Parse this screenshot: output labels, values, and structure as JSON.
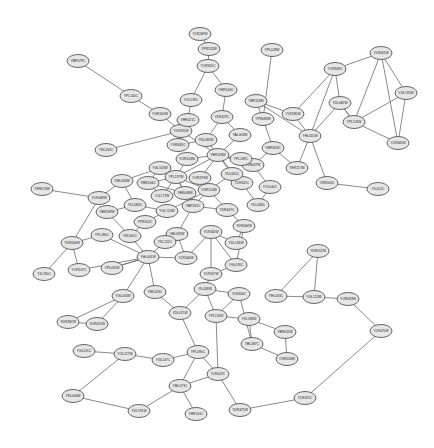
{
  "figure": {
    "type": "node-link-network-graph",
    "background_color": "#ffffff",
    "node_fill_color": "#e6e6e6",
    "node_stroke_color": "#555555",
    "edge_color": "#6b6b6b",
    "label_color": "#1a1a1a",
    "node_count": 97,
    "edge_count": 134,
    "node_shape": "ellipse",
    "node_width": 22,
    "node_height": 13,
    "label_format": "yeast-orf-identifier"
  },
  "graph_data": {
    "type": "network",
    "layout": "force-directed-spring",
    "width": 434,
    "height": 448,
    "nodes": [
      {
        "id": "n0",
        "label": "YLR249W",
        "x": 200,
        "y": 34
      },
      {
        "id": "n1",
        "label": "YPL028W",
        "x": 272,
        "y": 50
      },
      {
        "id": "n2",
        "label": "YOR361C",
        "x": 208,
        "y": 66
      },
      {
        "id": "n3",
        "label": "YBR079C",
        "x": 78,
        "y": 61
      },
      {
        "id": "n4",
        "label": "YPL140C",
        "x": 131,
        "y": 96
      },
      {
        "id": "n5",
        "label": "YGR162W",
        "x": 160,
        "y": 114
      },
      {
        "id": "n6",
        "label": "YOL139C",
        "x": 191,
        "y": 100
      },
      {
        "id": "n7",
        "label": "YMR146C",
        "x": 226,
        "y": 90
      },
      {
        "id": "n8",
        "label": "YDR429C",
        "x": 222,
        "y": 117
      },
      {
        "id": "n9",
        "label": "YBR118W",
        "x": 256,
        "y": 101
      },
      {
        "id": "n10",
        "label": "YPR080W",
        "x": 263,
        "y": 119
      },
      {
        "id": "n11",
        "label": "YLR335W",
        "x": 181,
        "y": 131
      },
      {
        "id": "n12",
        "label": "YKL081W",
        "x": 206,
        "y": 140
      },
      {
        "id": "n13",
        "label": "YAL003W",
        "x": 240,
        "y": 135
      },
      {
        "id": "n14",
        "label": "YBR118W",
        "x": 218,
        "y": 155
      },
      {
        "id": "n15",
        "label": "YMR309C",
        "x": 273,
        "y": 148
      },
      {
        "id": "n16",
        "label": "YJR007W",
        "x": 253,
        "y": 165
      },
      {
        "id": "n17",
        "label": "YOR204W",
        "x": 187,
        "y": 159
      },
      {
        "id": "n18",
        "label": "YNL244C",
        "x": 106,
        "y": 150
      },
      {
        "id": "n19",
        "label": "YMR146C",
        "x": 148,
        "y": 183
      },
      {
        "id": "n20",
        "label": "YPL237W",
        "x": 176,
        "y": 177
      },
      {
        "id": "n21",
        "label": "YGR214W",
        "x": 209,
        "y": 190
      },
      {
        "id": "n22",
        "label": "YLR441C",
        "x": 242,
        "y": 183
      },
      {
        "id": "n23",
        "label": "YOL040C",
        "x": 270,
        "y": 187
      },
      {
        "id": "n24",
        "label": "YBR181C",
        "x": 193,
        "y": 206
      },
      {
        "id": "n25",
        "label": "YDR447C",
        "x": 227,
        "y": 210
      },
      {
        "id": "n26",
        "label": "YGL123W",
        "x": 167,
        "y": 211
      },
      {
        "id": "n27",
        "label": "YDL083C",
        "x": 135,
        "y": 205
      },
      {
        "id": "n28",
        "label": "YER074W",
        "x": 42,
        "y": 189
      },
      {
        "id": "n29",
        "label": "YLR048W",
        "x": 99,
        "y": 198
      },
      {
        "id": "n30",
        "label": "YPL090C",
        "x": 102,
        "y": 235
      },
      {
        "id": "n31",
        "label": "YDR064W",
        "x": 72,
        "y": 243
      },
      {
        "id": "n32",
        "label": "YJL190C",
        "x": 44,
        "y": 274
      },
      {
        "id": "n33",
        "label": "YOR167C",
        "x": 79,
        "y": 270
      },
      {
        "id": "n34",
        "label": "YPL081W",
        "x": 112,
        "y": 268
      },
      {
        "id": "n35",
        "label": "YHL001W",
        "x": 148,
        "y": 257
      },
      {
        "id": "n36",
        "label": "YLR344W",
        "x": 186,
        "y": 258
      },
      {
        "id": "n37",
        "label": "YBL092W",
        "x": 177,
        "y": 234
      },
      {
        "id": "n38",
        "label": "YLR340W",
        "x": 211,
        "y": 232
      },
      {
        "id": "n39",
        "label": "YDL136W",
        "x": 236,
        "y": 243
      },
      {
        "id": "n40",
        "label": "YGL030W",
        "x": 123,
        "y": 296
      },
      {
        "id": "n41",
        "label": "YML026C",
        "x": 155,
        "y": 292
      },
      {
        "id": "n42",
        "label": "YDR382W",
        "x": 68,
        "y": 322
      },
      {
        "id": "n43",
        "label": "YIL018W",
        "x": 205,
        "y": 289
      },
      {
        "id": "n44",
        "label": "YLR406C",
        "x": 239,
        "y": 294
      },
      {
        "id": "n45",
        "label": "YDL075W",
        "x": 180,
        "y": 313
      },
      {
        "id": "n46",
        "label": "YPL131W",
        "x": 216,
        "y": 316
      },
      {
        "id": "n47",
        "label": "YKL180W",
        "x": 249,
        "y": 319
      },
      {
        "id": "n48",
        "label": "YBR031W",
        "x": 285,
        "y": 332
      },
      {
        "id": "n49",
        "label": "YHL033C",
        "x": 276,
        "y": 296
      },
      {
        "id": "n50",
        "label": "YGL123W",
        "x": 314,
        "y": 297
      },
      {
        "id": "n51",
        "label": "YOR063W",
        "x": 348,
        "y": 299
      },
      {
        "id": "n52",
        "label": "YDR012W",
        "x": 318,
        "y": 251
      },
      {
        "id": "n53",
        "label": "YLR075W",
        "x": 381,
        "y": 331
      },
      {
        "id": "n54",
        "label": "YGL031C",
        "x": 84,
        "y": 351
      },
      {
        "id": "n55",
        "label": "YOL127W",
        "x": 125,
        "y": 354
      },
      {
        "id": "n56",
        "label": "YGL147C",
        "x": 163,
        "y": 360
      },
      {
        "id": "n57",
        "label": "YPL090C",
        "x": 198,
        "y": 352
      },
      {
        "id": "n58",
        "label": "YLR029C",
        "x": 218,
        "y": 374
      },
      {
        "id": "n59",
        "label": "YML073C",
        "x": 180,
        "y": 386
      },
      {
        "id": "n60",
        "label": "YDL191W",
        "x": 139,
        "y": 411
      },
      {
        "id": "n61",
        "label": "YKL006W",
        "x": 73,
        "y": 396
      },
      {
        "id": "n62",
        "label": "YHR141C",
        "x": 196,
        "y": 414
      },
      {
        "id": "n63",
        "label": "YDR471W",
        "x": 240,
        "y": 410
      },
      {
        "id": "n64",
        "label": "YLR325C",
        "x": 305,
        "y": 398
      },
      {
        "id": "n65",
        "label": "YGR034W",
        "x": 287,
        "y": 359
      },
      {
        "id": "n66",
        "label": "YBL087C",
        "x": 252,
        "y": 344
      },
      {
        "id": "n67",
        "label": "YOR369C",
        "x": 335,
        "y": 69
      },
      {
        "id": "n68",
        "label": "YLR061W",
        "x": 381,
        "y": 53
      },
      {
        "id": "n69",
        "label": "YGL135W",
        "x": 406,
        "y": 93
      },
      {
        "id": "n70",
        "label": "YPL131W",
        "x": 354,
        "y": 122
      },
      {
        "id": "n71",
        "label": "YLR340W",
        "x": 398,
        "y": 143
      },
      {
        "id": "n72",
        "label": "YDL082W",
        "x": 340,
        "y": 103
      },
      {
        "id": "n73",
        "label": "YHL015W",
        "x": 310,
        "y": 136
      },
      {
        "id": "n74",
        "label": "YDR500C",
        "x": 327,
        "y": 183
      },
      {
        "id": "n75",
        "label": "YIL052C",
        "x": 378,
        "y": 189
      },
      {
        "id": "n76",
        "label": "YLR185W",
        "x": 293,
        "y": 114
      },
      {
        "id": "n77",
        "label": "YER117W",
        "x": 297,
        "y": 168
      },
      {
        "id": "n78",
        "label": "YPR102C",
        "x": 145,
        "y": 222
      },
      {
        "id": "n79",
        "label": "YJL177W",
        "x": 162,
        "y": 196
      },
      {
        "id": "n80",
        "label": "YDL184C",
        "x": 258,
        "y": 205
      },
      {
        "id": "n81",
        "label": "YGL076C",
        "x": 236,
        "y": 265
      },
      {
        "id": "n82",
        "label": "YDR025W",
        "x": 97,
        "y": 324
      },
      {
        "id": "n83",
        "label": "YBR189W",
        "x": 107,
        "y": 212
      },
      {
        "id": "n84",
        "label": "YNL301C",
        "x": 130,
        "y": 236
      },
      {
        "id": "n85",
        "label": "YOR293W",
        "x": 200,
        "y": 178
      },
      {
        "id": "n86",
        "label": "YPL249C",
        "x": 241,
        "y": 159
      },
      {
        "id": "n87",
        "label": "YGR085C",
        "x": 178,
        "y": 145
      },
      {
        "id": "n88",
        "label": "YDL061C",
        "x": 232,
        "y": 174
      },
      {
        "id": "n89",
        "label": "YKL152C",
        "x": 165,
        "y": 242
      },
      {
        "id": "n90",
        "label": "YLR167W",
        "x": 211,
        "y": 274
      },
      {
        "id": "n91",
        "label": "YDR064W",
        "x": 244,
        "y": 226
      },
      {
        "id": "n92",
        "label": "YBR048W",
        "x": 185,
        "y": 193
      },
      {
        "id": "n93",
        "label": "YGL103W",
        "x": 160,
        "y": 168
      },
      {
        "id": "n94",
        "label": "YML063W",
        "x": 122,
        "y": 181
      },
      {
        "id": "n95",
        "label": "YHR021C",
        "x": 188,
        "y": 120
      },
      {
        "id": "n96",
        "label": "YPR132W",
        "x": 209,
        "y": 49
      }
    ],
    "edges": [
      [
        "n0",
        "n96"
      ],
      [
        "n96",
        "n2"
      ],
      [
        "n2",
        "n6"
      ],
      [
        "n2",
        "n7"
      ],
      [
        "n6",
        "n95"
      ],
      [
        "n95",
        "n87"
      ],
      [
        "n7",
        "n8"
      ],
      [
        "n8",
        "n12"
      ],
      [
        "n8",
        "n13"
      ],
      [
        "n9",
        "n10"
      ],
      [
        "n1",
        "n10"
      ],
      [
        "n10",
        "n15"
      ],
      [
        "n3",
        "n4"
      ],
      [
        "n4",
        "n5"
      ],
      [
        "n5",
        "n11"
      ],
      [
        "n11",
        "n14"
      ],
      [
        "n87",
        "n12"
      ],
      [
        "n12",
        "n14"
      ],
      [
        "n13",
        "n14"
      ],
      [
        "n14",
        "n16"
      ],
      [
        "n14",
        "n86"
      ],
      [
        "n14",
        "n88"
      ],
      [
        "n14",
        "n85"
      ],
      [
        "n14",
        "n17"
      ],
      [
        "n14",
        "n20"
      ],
      [
        "n15",
        "n16"
      ],
      [
        "n16",
        "n23"
      ],
      [
        "n14",
        "n22"
      ],
      [
        "n22",
        "n80"
      ],
      [
        "n17",
        "n20"
      ],
      [
        "n18",
        "n11"
      ],
      [
        "n19",
        "n20"
      ],
      [
        "n20",
        "n21"
      ],
      [
        "n20",
        "n24"
      ],
      [
        "n20",
        "n92"
      ],
      [
        "n85",
        "n21"
      ],
      [
        "n21",
        "n24"
      ],
      [
        "n21",
        "n25"
      ],
      [
        "n21",
        "n26"
      ],
      [
        "n24",
        "n25"
      ],
      [
        "n25",
        "n91"
      ],
      [
        "n26",
        "n27"
      ],
      [
        "n27",
        "n94"
      ],
      [
        "n28",
        "n29"
      ],
      [
        "n29",
        "n94"
      ],
      [
        "n94",
        "n93"
      ],
      [
        "n93",
        "n19"
      ],
      [
        "n29",
        "n31"
      ],
      [
        "n30",
        "n31"
      ],
      [
        "n31",
        "n33"
      ],
      [
        "n32",
        "n31"
      ],
      [
        "n33",
        "n35"
      ],
      [
        "n34",
        "n35"
      ],
      [
        "n35",
        "n84"
      ],
      [
        "n35",
        "n89"
      ],
      [
        "n35",
        "n36"
      ],
      [
        "n35",
        "n40"
      ],
      [
        "n35",
        "n41"
      ],
      [
        "n35",
        "n30"
      ],
      [
        "n83",
        "n84"
      ],
      [
        "n84",
        "n78"
      ],
      [
        "n78",
        "n26"
      ],
      [
        "n89",
        "n37"
      ],
      [
        "n36",
        "n37"
      ],
      [
        "n36",
        "n38"
      ],
      [
        "n37",
        "n24"
      ],
      [
        "n38",
        "n39"
      ],
      [
        "n38",
        "n81"
      ],
      [
        "n38",
        "n90"
      ],
      [
        "n39",
        "n91"
      ],
      [
        "n81",
        "n90"
      ],
      [
        "n90",
        "n43"
      ],
      [
        "n43",
        "n44"
      ],
      [
        "n43",
        "n45"
      ],
      [
        "n43",
        "n46"
      ],
      [
        "n41",
        "n45"
      ],
      [
        "n40",
        "n42"
      ],
      [
        "n40",
        "n82"
      ],
      [
        "n44",
        "n46"
      ],
      [
        "n46",
        "n47"
      ],
      [
        "n46",
        "n58"
      ],
      [
        "n47",
        "n48"
      ],
      [
        "n49",
        "n50"
      ],
      [
        "n50",
        "n51"
      ],
      [
        "n50",
        "n52"
      ],
      [
        "n52",
        "n49"
      ],
      [
        "n51",
        "n53"
      ],
      [
        "n48",
        "n65"
      ],
      [
        "n54",
        "n55"
      ],
      [
        "n55",
        "n56"
      ],
      [
        "n55",
        "n61"
      ],
      [
        "n56",
        "n57"
      ],
      [
        "n57",
        "n58"
      ],
      [
        "n57",
        "n59"
      ],
      [
        "n58",
        "n59"
      ],
      [
        "n58",
        "n63"
      ],
      [
        "n59",
        "n60"
      ],
      [
        "n60",
        "n61"
      ],
      [
        "n59",
        "n62"
      ],
      [
        "n63",
        "n64"
      ],
      [
        "n65",
        "n66"
      ],
      [
        "n66",
        "n47"
      ],
      [
        "n67",
        "n68"
      ],
      [
        "n67",
        "n72"
      ],
      [
        "n67",
        "n73"
      ],
      [
        "n68",
        "n69"
      ],
      [
        "n68",
        "n70"
      ],
      [
        "n68",
        "n71"
      ],
      [
        "n69",
        "n70"
      ],
      [
        "n69",
        "n71"
      ],
      [
        "n70",
        "n71"
      ],
      [
        "n70",
        "n72"
      ],
      [
        "n72",
        "n73"
      ],
      [
        "n72",
        "n70"
      ],
      [
        "n73",
        "n76"
      ],
      [
        "n73",
        "n74"
      ],
      [
        "n73",
        "n77"
      ],
      [
        "n74",
        "n75"
      ],
      [
        "n76",
        "n9"
      ],
      [
        "n73",
        "n9"
      ],
      [
        "n15",
        "n77"
      ],
      [
        "n80",
        "n23"
      ],
      [
        "n86",
        "n16"
      ],
      [
        "n88",
        "n21"
      ],
      [
        "n92",
        "n19"
      ],
      [
        "n19",
        "n79"
      ],
      [
        "n79",
        "n20"
      ],
      [
        "n27",
        "n83"
      ],
      [
        "n91",
        "n81"
      ],
      [
        "n45",
        "n57"
      ],
      [
        "n35",
        "n34"
      ],
      [
        "n82",
        "n42"
      ],
      [
        "n64",
        "n53"
      ],
      [
        "n66",
        "n44"
      ],
      [
        "n67",
        "n76"
      ]
    ]
  }
}
